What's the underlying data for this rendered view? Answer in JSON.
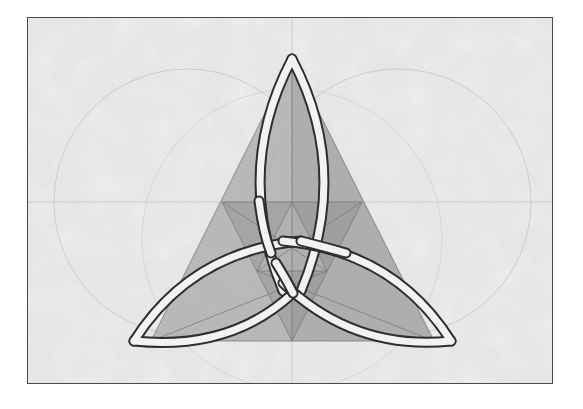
{
  "figure": {
    "elements": {
      "construction_circles": 2,
      "construction_lines": [
        "horizontal-axis",
        "vertical-axis"
      ],
      "base_triangle": "equilateral",
      "knot_loops": 3
    },
    "colors": {
      "background": "#e8e8e8",
      "frame_border": "#4a4a4a",
      "construction_line": "#bdbdbd",
      "triangle_fill": "#9a9a9a",
      "band_fill": "#f2f2f2",
      "band_outline": "#2e2e2e"
    }
  }
}
